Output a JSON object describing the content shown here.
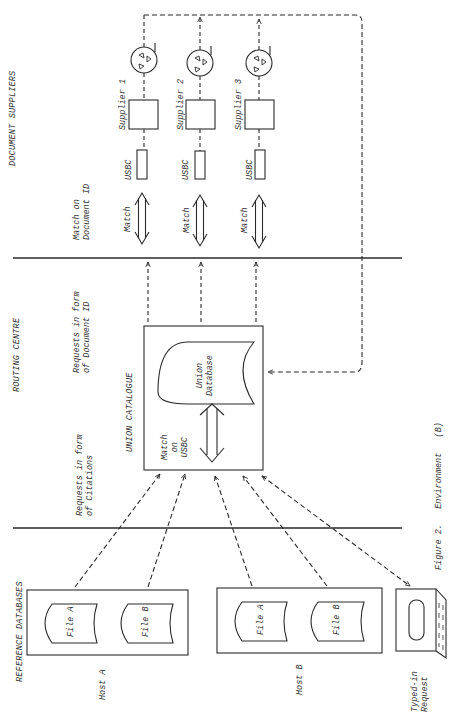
{
  "sections": {
    "suppliers": "DOCUMENT SUPPLIERS",
    "routing": "ROUTING CENTRE",
    "reference": "REFERENCE DATABASES"
  },
  "flow_labels": {
    "match_doc_id": [
      "Match on",
      "Document ID"
    ],
    "requests_doc_id": [
      "Requests in form",
      "of Document ID"
    ],
    "requests_citations": [
      "Requests in form",
      "of Citations"
    ]
  },
  "suppliers": [
    {
      "name": "Supplier 1",
      "usbc": "USBC",
      "match": "Match"
    },
    {
      "name": "Supplier 2",
      "usbc": "USBC",
      "match": "Match"
    },
    {
      "name": "Supplier 3",
      "usbc": "USBC",
      "match": "Match"
    }
  ],
  "union_catalogue": {
    "title": "UNION CATALOGUE",
    "database": [
      "Union",
      "Database"
    ],
    "match": [
      "Match",
      "on",
      "USBC"
    ]
  },
  "hosts": [
    {
      "name": "Host A",
      "files": [
        "File A",
        "File B"
      ]
    },
    {
      "name": "Host B",
      "files": [
        "File A",
        "File B"
      ]
    }
  ],
  "terminal": {
    "label": [
      "Typed-in",
      "Request"
    ]
  },
  "caption": "Figure 2.   Environment   (B)",
  "colors": {
    "ink": "#2a2a2a",
    "background": "#ffffff"
  }
}
